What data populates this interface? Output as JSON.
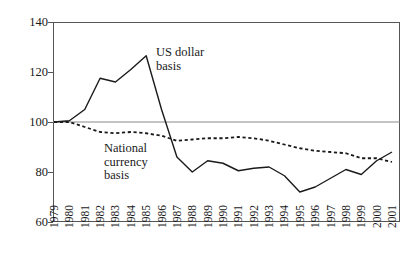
{
  "chart_data": {
    "type": "line",
    "title": "",
    "subtitle": "",
    "xlabel": "",
    "ylabel": "",
    "xlim": [
      1979,
      2001
    ],
    "ylim": [
      60,
      140
    ],
    "yticks": [
      60,
      80,
      100,
      120,
      140
    ],
    "grid": false,
    "gridlines_drawn_at": [
      100
    ],
    "legend_position": "inline-annotations",
    "x": [
      1979,
      1980,
      1981,
      1982,
      1983,
      1984,
      1985,
      1986,
      1987,
      1988,
      1989,
      1990,
      1991,
      1992,
      1993,
      1994,
      1995,
      1996,
      1997,
      1998,
      1999,
      2000,
      2001
    ],
    "categories": [
      "1979",
      "1980",
      "1981",
      "1982",
      "1983",
      "1984",
      "1985",
      "1986",
      "1987",
      "1988",
      "1989",
      "1990",
      "1991",
      "1992",
      "1993",
      "1994",
      "1995",
      "1996",
      "1997",
      "1998",
      "1999",
      "2000",
      "2001"
    ],
    "series": [
      {
        "name": "US dollar basis",
        "style": "solid",
        "color": "#1a1a1a",
        "values": [
          100,
          100.5,
          105,
          117.5,
          116,
          121,
          126.5,
          105,
          86,
          80,
          84.5,
          83.5,
          80.5,
          81.5,
          82,
          78.5,
          72,
          74,
          77.5,
          81,
          79,
          84.5,
          88
        ]
      },
      {
        "name": "National currency basis",
        "style": "dotted",
        "color": "#1a1a1a",
        "values": [
          100,
          100,
          98,
          96,
          95.5,
          96,
          95.5,
          94.5,
          92.5,
          93,
          93.5,
          93.5,
          94,
          93.5,
          92.5,
          91,
          89.5,
          88.5,
          88,
          87.5,
          85.5,
          85.5,
          84
        ]
      }
    ],
    "annotations": [
      {
        "id": "us-dollar",
        "text": "US dollar\nbasis",
        "x": 156,
        "y": 46
      },
      {
        "id": "national",
        "text": "National\ncurrency\nbasis",
        "x": 104,
        "y": 142
      }
    ]
  },
  "axis": {
    "y_labels": [
      "140",
      "120",
      "100",
      "80",
      "60"
    ],
    "x_labels": [
      "1979",
      "1980",
      "1981",
      "1982",
      "1983",
      "1984",
      "1985",
      "1986",
      "1987",
      "1988",
      "1989",
      "1990",
      "1991",
      "1992",
      "1993",
      "1994",
      "1995",
      "1996",
      "1997",
      "1998",
      "1999",
      "2000",
      "2001"
    ]
  },
  "annotations": {
    "us_dollar": "US dollar\nbasis",
    "national_currency": "National\ncurrency\nbasis"
  },
  "colors": {
    "axis": "#555555",
    "line": "#1a1a1a",
    "background": "#ffffff"
  }
}
